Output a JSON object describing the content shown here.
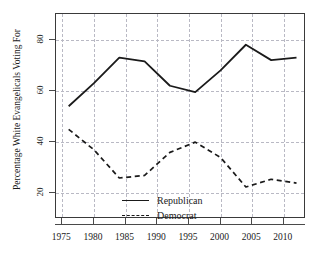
{
  "chart_data": {
    "type": "line",
    "title": "",
    "xlabel": "",
    "ylabel": "Percentage White Evangelicals Voting For",
    "xlim": [
      1974,
      2013.5
    ],
    "ylim": [
      10,
      90
    ],
    "xticks": [
      1975,
      1980,
      1985,
      1990,
      1995,
      2000,
      2005,
      2010
    ],
    "xtick_labels": [
      "1975",
      "1980",
      "1985",
      "1990",
      "1995",
      "2000",
      "2005",
      "2010"
    ],
    "yticks": [
      20,
      40,
      60,
      80
    ],
    "ytick_labels": [
      "20",
      "40",
      "60",
      "80"
    ],
    "grid": true,
    "grid_style": "dashed",
    "grid_color": "#b9b9c4",
    "legend_position": "lower-left-inside",
    "x": [
      1976,
      1980,
      1984,
      1988,
      1992,
      1996,
      2000,
      2004,
      2008,
      2012
    ],
    "series": [
      {
        "name": "Republican",
        "style": "solid",
        "color": "#1a1a1a",
        "values": [
          54,
          63,
          73,
          71.5,
          62,
          59.5,
          68,
          78,
          72,
          73
        ]
      },
      {
        "name": "Democrat",
        "style": "dashed",
        "color": "#1a1a1a",
        "values": [
          45,
          37,
          26,
          27,
          36,
          40,
          34,
          22.5,
          25.5,
          24
        ]
      }
    ]
  },
  "legend": {
    "items": [
      {
        "label": "Republican",
        "style": "solid"
      },
      {
        "label": "Democrat",
        "style": "dashed"
      }
    ]
  },
  "page_bleed": {
    "text": ""
  }
}
